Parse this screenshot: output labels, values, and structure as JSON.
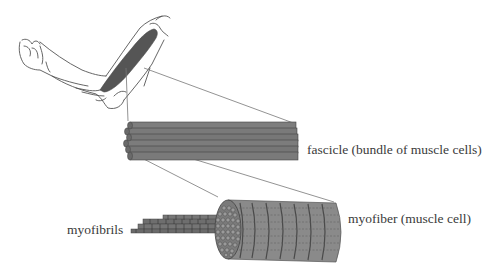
{
  "diagram": {
    "labels": {
      "fascicle": "fascicle (bundle of muscle cells)",
      "myofiber": "myofiber (muscle cell)",
      "myofibrils": "myofibrils"
    },
    "colors": {
      "background": "#ffffff",
      "muscle": "#555555",
      "fascicle_rod": "#7a7a7a",
      "fiber_body": "#8c8c8c",
      "outline": "#444444",
      "connector": "#666666",
      "text": "#3a3a3a"
    }
  }
}
